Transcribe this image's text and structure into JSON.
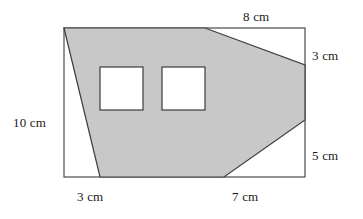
{
  "figure": {
    "type": "geometry-diagram",
    "colors": {
      "shaded_fill": "#c8c8c8",
      "outline": "#3c3c3c",
      "rectangle_outline": "#4a4a4a",
      "background": "#ffffff",
      "hole_fill": "#ffffff",
      "text": "#1a1a1a"
    },
    "bounding_rectangle": {
      "x": 64,
      "y": 28,
      "width": 241,
      "height": 149
    },
    "shaded_polygon_points": "64,28 205,28 305,65 305,120 224,177 100,177",
    "holes": [
      {
        "name": "square-hole-left",
        "x": 100,
        "y": 67,
        "width": 43,
        "height": 43
      },
      {
        "name": "square-hole-right",
        "x": 162,
        "y": 67,
        "width": 43,
        "height": 43
      }
    ],
    "labels": {
      "top": "8 cm",
      "right_upper": "3 cm",
      "right_lower": "5 cm",
      "left": "10 cm",
      "bottom_left": "3 cm",
      "bottom_right": "7 cm"
    }
  },
  "chart_data": {
    "type": "diagram",
    "title": "",
    "unit": "cm",
    "dimensions": [
      {
        "edge": "top",
        "label": "8 cm",
        "value": 8,
        "unit": "cm"
      },
      {
        "edge": "right-upper",
        "label": "3 cm",
        "value": 3,
        "unit": "cm"
      },
      {
        "edge": "right-lower",
        "label": "5 cm",
        "value": 5,
        "unit": "cm"
      },
      {
        "edge": "left",
        "label": "10 cm",
        "value": 10,
        "unit": "cm"
      },
      {
        "edge": "bottom-left",
        "label": "3 cm",
        "value": 3,
        "unit": "cm"
      },
      {
        "edge": "bottom-right",
        "label": "7 cm",
        "value": 7,
        "unit": "cm"
      }
    ]
  }
}
